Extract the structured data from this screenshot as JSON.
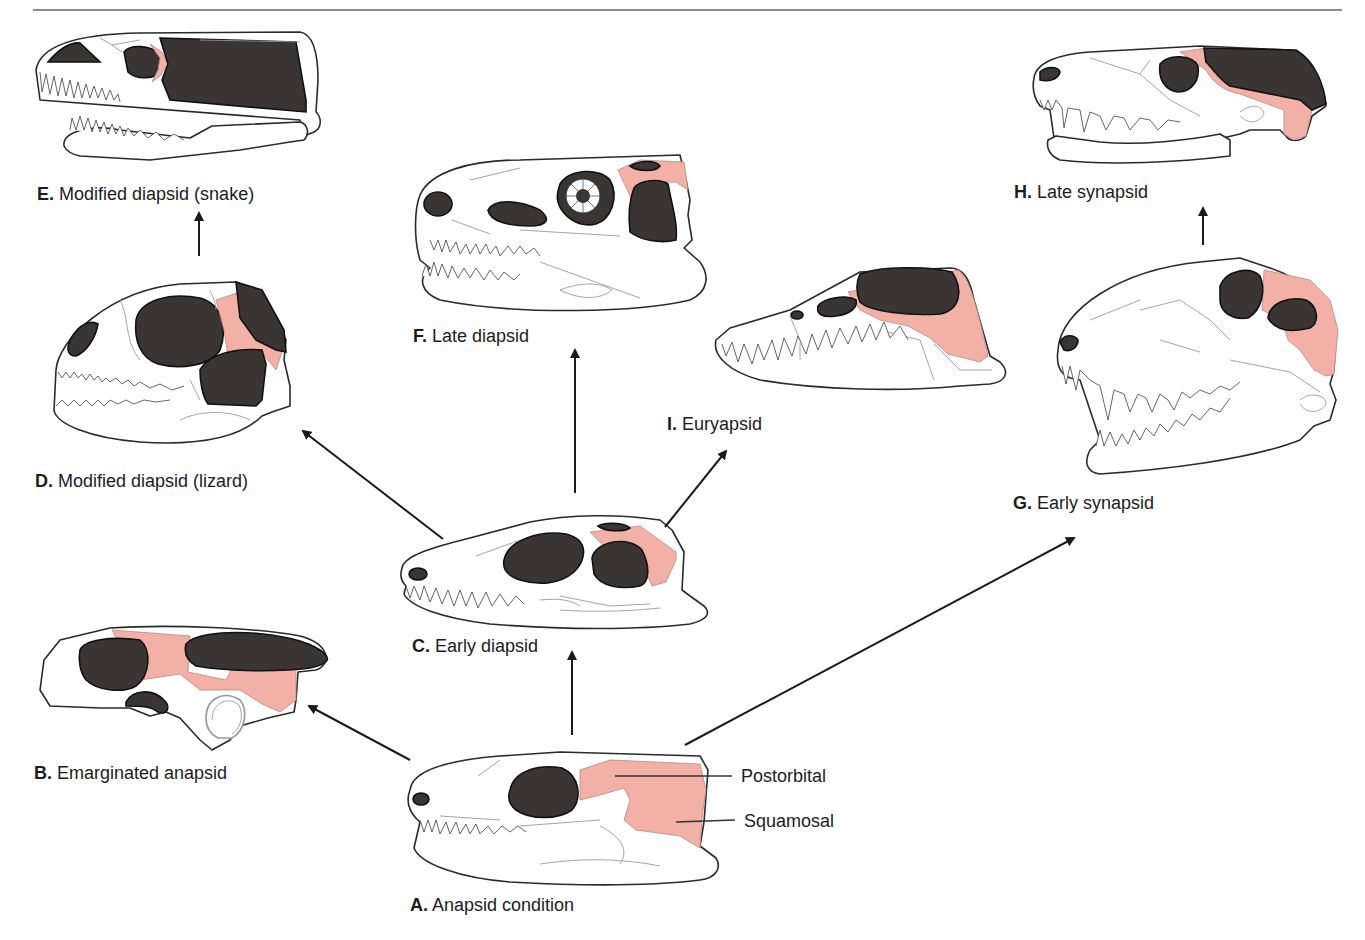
{
  "figure": {
    "title_rule": {
      "x1": 33,
      "x2": 1342,
      "y": 10,
      "color": "#8a8a8a"
    },
    "colors": {
      "fenestra_fill": "#3a3533",
      "highlight_bone": "#f2b0a6",
      "outline": "#2a2a2a",
      "suture": "#9a9a9a"
    },
    "panels": [
      {
        "id": "A",
        "letter": "A.",
        "name": "Anapsid condition"
      },
      {
        "id": "B",
        "letter": "B.",
        "name": "Emarginated anapsid"
      },
      {
        "id": "C",
        "letter": "C.",
        "name": "Early diapsid"
      },
      {
        "id": "D",
        "letter": "D.",
        "name": "Modified diapsid (lizard)"
      },
      {
        "id": "E",
        "letter": "E.",
        "name": "Modified diapsid (snake)"
      },
      {
        "id": "F",
        "letter": "F.",
        "name": "Late diapsid"
      },
      {
        "id": "G",
        "letter": "G.",
        "name": "Early synapsid"
      },
      {
        "id": "H",
        "letter": "H.",
        "name": "Late synapsid"
      },
      {
        "id": "I",
        "letter": "I.",
        "name": "Euryapsid"
      }
    ],
    "callouts": [
      {
        "text": "Postorbital",
        "points_to": "A"
      },
      {
        "text": "Squamosal",
        "points_to": "A"
      }
    ],
    "arrows": [
      {
        "from": "A",
        "to": "B"
      },
      {
        "from": "A",
        "to": "C"
      },
      {
        "from": "A",
        "to": "G"
      },
      {
        "from": "C",
        "to": "D"
      },
      {
        "from": "C",
        "to": "F"
      },
      {
        "from": "C",
        "to": "I"
      },
      {
        "from": "D",
        "to": "E"
      },
      {
        "from": "G",
        "to": "H"
      }
    ],
    "legend": {
      "dark_regions": "temporal fenestrae / orbit / nares",
      "pink_regions": "postorbital and squamosal bones"
    }
  }
}
